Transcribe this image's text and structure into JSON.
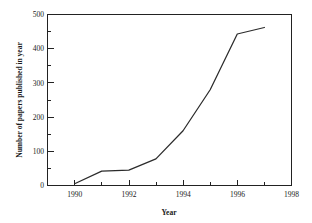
{
  "chart_data": {
    "type": "line",
    "title": "",
    "subtitle": "",
    "xlabel": "Year",
    "ylabel": "Number of papers published in year",
    "x": [
      1990,
      1991,
      1992,
      1993,
      1994,
      1995,
      1996,
      1997
    ],
    "series": [
      {
        "name": "Papers published",
        "values": [
          5,
          42,
          45,
          78,
          160,
          280,
          443,
          462
        ]
      }
    ],
    "xlim": [
      1989,
      1998
    ],
    "ylim": [
      0,
      500
    ],
    "xticks": [
      1990,
      1992,
      1994,
      1996,
      1998
    ],
    "xtick_labels": [
      "1990",
      "1992",
      "1994",
      "1996",
      "1998"
    ],
    "x_minor_ticks": [
      1989,
      1991,
      1993,
      1995,
      1997
    ],
    "yticks": [
      0,
      100,
      200,
      300,
      400,
      500
    ],
    "ytick_labels": [
      "0",
      "100",
      "200",
      "300",
      "400",
      "500"
    ],
    "y_minor_ticks": [
      50,
      150,
      250,
      350,
      450
    ],
    "grid": false,
    "legend": false,
    "legend_position": "none",
    "annotations": [],
    "colors": {
      "background": "#ffffff",
      "axis": "#222222",
      "line": "#2b2b2b",
      "text": "#1a1a1a"
    }
  }
}
